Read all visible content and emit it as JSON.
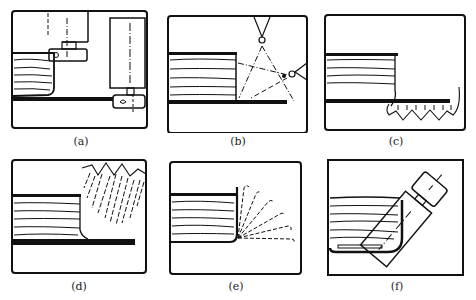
{
  "figure": {
    "panels": [
      {
        "id": "a",
        "caption": "(a)",
        "description": "Weld bead with two horizontal/vertical torch positions (fixed clamps)"
      },
      {
        "id": "b",
        "caption": "(b)",
        "description": "Weld bead with two torch positions and dash-dot aim lines toward fillet corner"
      },
      {
        "id": "c",
        "caption": "(c)",
        "description": "Weld bead with zigzag wave below base plate"
      },
      {
        "id": "d",
        "caption": "(d)",
        "description": "Weld bead with zigzag oscillation spray above"
      },
      {
        "id": "e",
        "caption": "(e)",
        "description": "Weld bead with fan of dashed spray lines from corner"
      },
      {
        "id": "f",
        "caption": "(f)",
        "description": "Weld bead with angled torch at rounded corner"
      }
    ],
    "colors": {
      "ink": "#111111",
      "paper": "#ffffff"
    }
  }
}
